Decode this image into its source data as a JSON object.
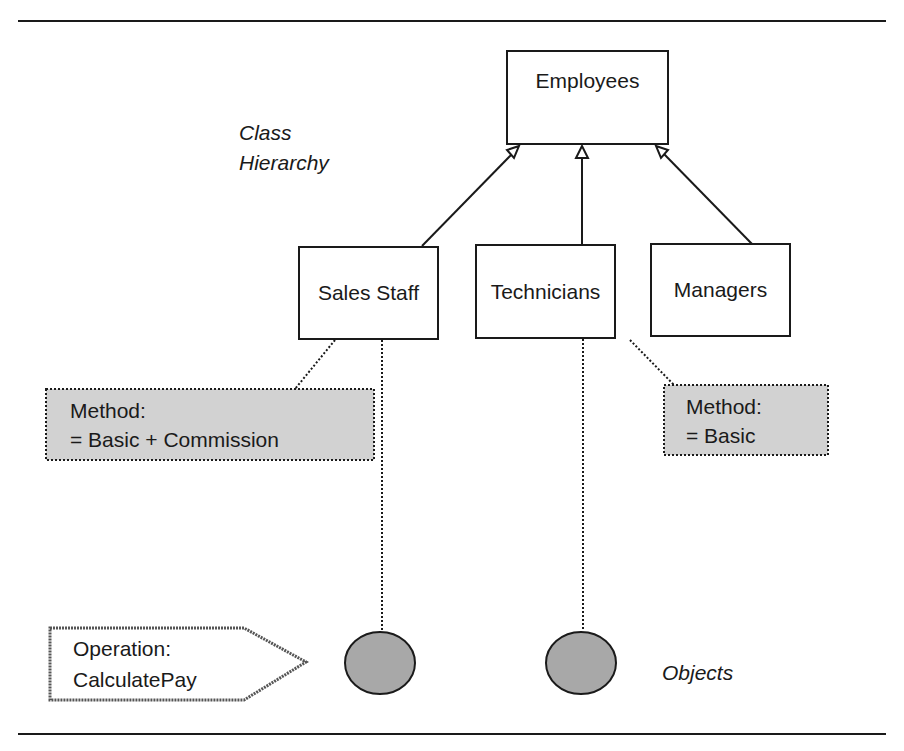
{
  "diagram": {
    "labels": {
      "class_hierarchy_line1": "Class",
      "class_hierarchy_line2": "Hierarchy",
      "objects": "Objects"
    },
    "classes": {
      "parent": "Employees",
      "children": [
        "Sales Staff",
        "Technicians",
        "Managers"
      ]
    },
    "methods": {
      "sales": {
        "line1": "Method:",
        "line2": "= Basic + Commission"
      },
      "technicians": {
        "line1": "Method:",
        "line2": "= Basic"
      }
    },
    "operation": {
      "line1": "Operation:",
      "line2": "CalculatePay"
    },
    "colors": {
      "stroke": "#1a1a1a",
      "note_fill": "#d2d2d2",
      "object_fill": "#a8a8a8"
    }
  }
}
